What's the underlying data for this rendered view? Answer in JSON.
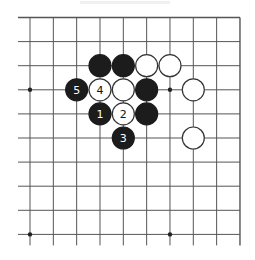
{
  "diagram": {
    "type": "go-board-fragment",
    "view": "top-right corner region",
    "grid": {
      "columns": 10,
      "rows": 10,
      "x0": 30,
      "y0": 17.5,
      "dx": 23.33,
      "dy": 24.1,
      "left_extension": 12,
      "bottom_extension": 11,
      "top_is_edge": true,
      "right_is_edge": true,
      "line_color": "#555555"
    },
    "star_points": [
      {
        "col": 0,
        "row": 3
      },
      {
        "col": 6,
        "row": 3
      },
      {
        "col": 0,
        "row": 9
      },
      {
        "col": 6,
        "row": 9
      }
    ],
    "stones": [
      {
        "col": 3,
        "row": 2,
        "color": "black",
        "label": ""
      },
      {
        "col": 4,
        "row": 2,
        "color": "black",
        "label": ""
      },
      {
        "col": 5,
        "row": 2,
        "color": "white",
        "label": ""
      },
      {
        "col": 6,
        "row": 2,
        "color": "white",
        "label": ""
      },
      {
        "col": 2,
        "row": 3,
        "color": "black",
        "label": "5"
      },
      {
        "col": 3,
        "row": 3,
        "color": "white",
        "label": "4"
      },
      {
        "col": 4,
        "row": 3,
        "color": "white",
        "label": ""
      },
      {
        "col": 5,
        "row": 3,
        "color": "black",
        "label": ""
      },
      {
        "col": 7,
        "row": 3,
        "color": "white",
        "label": ""
      },
      {
        "col": 3,
        "row": 4,
        "color": "black",
        "label": "1"
      },
      {
        "col": 4,
        "row": 4,
        "color": "white",
        "label": "2"
      },
      {
        "col": 5,
        "row": 4,
        "color": "black",
        "label": ""
      },
      {
        "col": 4,
        "row": 5,
        "color": "black",
        "label": "3"
      },
      {
        "col": 7,
        "row": 5,
        "color": "white",
        "label": ""
      }
    ],
    "colors": {
      "black_stone": "#1c1c1c",
      "white_stone": "#ffffff",
      "white_stone_border": "#333333",
      "black_label": "#ffffff",
      "white_label": "#111111",
      "star_point": "#222222"
    },
    "stone_radius": 11
  }
}
